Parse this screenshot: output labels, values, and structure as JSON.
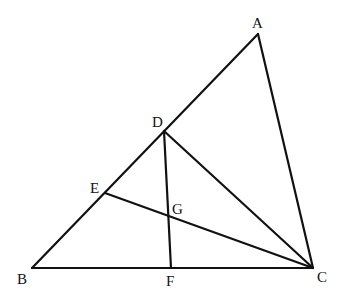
{
  "diagram": {
    "type": "geometry",
    "points": {
      "A": {
        "label": "A",
        "x": 258,
        "y": 34,
        "label_x": 252,
        "label_y": 28
      },
      "B": {
        "label": "B",
        "x": 32,
        "y": 268,
        "label_x": 17,
        "label_y": 284
      },
      "C": {
        "label": "C",
        "x": 313,
        "y": 268,
        "label_x": 317,
        "label_y": 282
      },
      "D": {
        "label": "D",
        "x": 164,
        "y": 131,
        "label_x": 152,
        "label_y": 127
      },
      "E": {
        "label": "E",
        "x": 105,
        "y": 193,
        "label_x": 90,
        "label_y": 193
      },
      "F": {
        "label": "F",
        "x": 171,
        "y": 268,
        "label_x": 166,
        "label_y": 286
      },
      "G": {
        "label": "G",
        "x": 170,
        "y": 216,
        "label_x": 172,
        "label_y": 214
      }
    },
    "segments": [
      {
        "name": "AB",
        "from": "A",
        "to": "B"
      },
      {
        "name": "BC",
        "from": "B",
        "to": "C"
      },
      {
        "name": "AC",
        "from": "A",
        "to": "C"
      },
      {
        "name": "DC",
        "from": "D",
        "to": "C"
      },
      {
        "name": "DF",
        "from": "D",
        "to": "F"
      },
      {
        "name": "EC",
        "from": "E",
        "to": "C"
      }
    ],
    "line_color": "#111111",
    "background": "#ffffff"
  }
}
